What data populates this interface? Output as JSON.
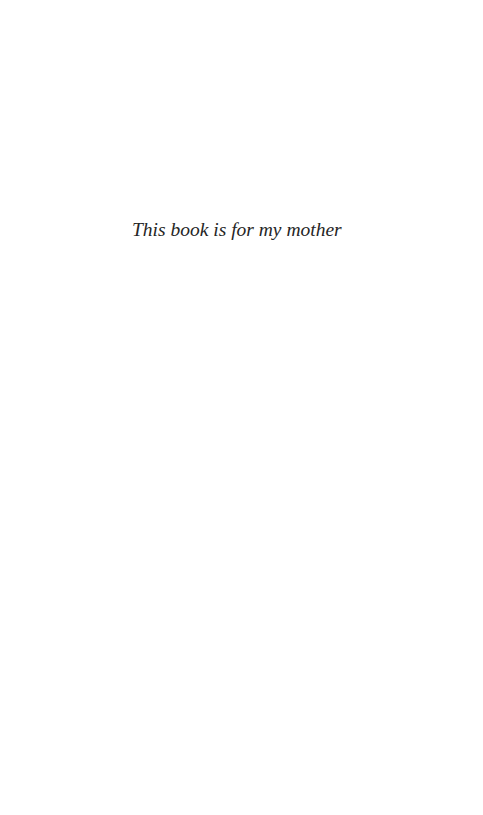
{
  "page": {
    "dedication": "This book is for my mother",
    "background_color": "#ffffff",
    "text_color": "#262626"
  }
}
